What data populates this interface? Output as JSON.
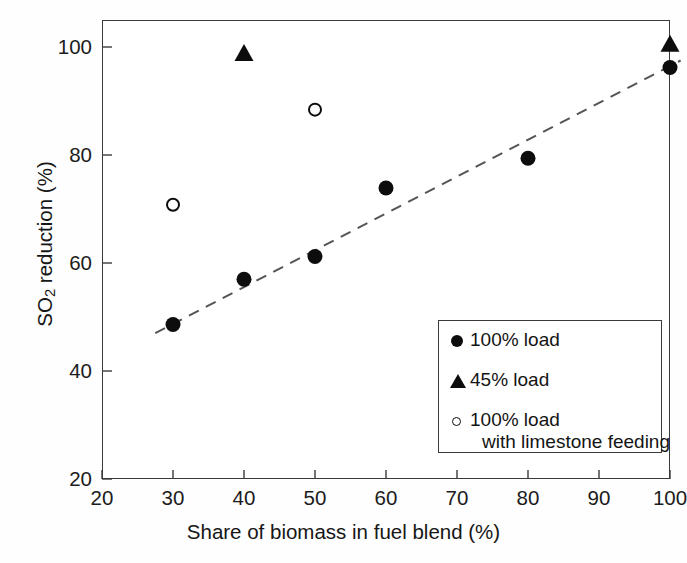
{
  "chart_data": {
    "type": "scatter",
    "title": "",
    "xlabel": "Share of biomass in fuel blend (%)",
    "ylabel_html": "SO<sub>2</sub> reduction (%)",
    "ylabel": "SO2 reduction (%)",
    "xlim": [
      20,
      100
    ],
    "ylim": [
      20,
      100
    ],
    "xticks": [
      20,
      30,
      40,
      50,
      60,
      70,
      80,
      90,
      100
    ],
    "yticks": [
      20,
      40,
      60,
      80,
      100
    ],
    "xtick_labels": [
      "20",
      "30",
      "40",
      "50",
      "60",
      "70",
      "80",
      "90",
      "100"
    ],
    "ytick_labels": [
      "20",
      "40",
      "60",
      "80",
      "100"
    ],
    "grid": false,
    "legend_position": "lower-right",
    "series": [
      {
        "name": "100% load",
        "marker": "filled-circle",
        "color": "#0d0d0d",
        "points": [
          {
            "x": 30,
            "y": 48.6
          },
          {
            "x": 40,
            "y": 57.0
          },
          {
            "x": 50,
            "y": 61.2
          },
          {
            "x": 60,
            "y": 73.9
          },
          {
            "x": 80,
            "y": 79.4
          },
          {
            "x": 100,
            "y": 96.2
          }
        ]
      },
      {
        "name": "45% load",
        "marker": "filled-triangle",
        "color": "#0d0d0d",
        "points": [
          {
            "x": 40,
            "y": 98.8
          },
          {
            "x": 100,
            "y": 100.5
          }
        ]
      },
      {
        "name": "100% load with limestone feeding",
        "marker": "open-circle",
        "color": "#0d0d0d",
        "points": [
          {
            "x": 30,
            "y": 70.8
          },
          {
            "x": 50,
            "y": 88.4
          }
        ]
      }
    ],
    "trendline": {
      "style": "dashed",
      "color": "#555555",
      "x": [
        27.5,
        101.5
      ],
      "y": [
        47.0,
        97.5
      ]
    }
  },
  "legend": {
    "items": [
      {
        "marker": "filled-circle",
        "label": "100% load",
        "label_line2": ""
      },
      {
        "marker": "filled-triangle",
        "label": "45% load",
        "label_line2": ""
      },
      {
        "marker": "open-circle",
        "label": "100% load",
        "label_line2": "with limestone feeding"
      }
    ]
  },
  "axes": {
    "x_title": "Share of biomass in fuel blend (%)",
    "y_title_part1": "SO",
    "y_title_sub": "2",
    "y_title_part2": " reduction (%)"
  }
}
